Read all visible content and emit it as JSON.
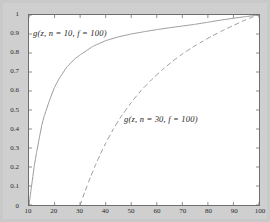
{
  "chart_data": {
    "type": "line",
    "title": "",
    "xlabel": "",
    "ylabel": "",
    "xlim": [
      10,
      100
    ],
    "ylim": [
      0,
      1
    ],
    "grid": false,
    "legend_position": "inline-annotations",
    "xticks": [
      "10",
      "20",
      "30",
      "40",
      "50",
      "60",
      "70",
      "80",
      "90",
      "100"
    ],
    "xtick_values": [
      10,
      20,
      30,
      40,
      50,
      60,
      70,
      80,
      90,
      100
    ],
    "yticks": [
      "0",
      "0.1",
      "0.2",
      "0.3",
      "0.4",
      "0.5",
      "0.6",
      "0.7",
      "0.8",
      "0.9",
      "1"
    ],
    "ytick_values": [
      0,
      0.1,
      0.2,
      0.3,
      0.4,
      0.5,
      0.6,
      0.7,
      0.8,
      0.9,
      1
    ],
    "series": [
      {
        "name": "g(z, n = 10, f = 100)",
        "style": "solid",
        "color": "#9a9a9a",
        "label_text": "g(z, n = 10, f = 100)",
        "x": [
          10,
          11,
          12,
          13,
          14,
          15,
          16,
          18,
          20,
          22,
          25,
          28,
          30,
          35,
          40,
          45,
          50,
          55,
          60,
          65,
          70,
          75,
          80,
          85,
          90,
          95,
          100
        ],
        "values": [
          0,
          0.1,
          0.2,
          0.28,
          0.35,
          0.42,
          0.47,
          0.55,
          0.62,
          0.67,
          0.73,
          0.77,
          0.79,
          0.835,
          0.865,
          0.885,
          0.9,
          0.912,
          0.923,
          0.933,
          0.942,
          0.951,
          0.962,
          0.973,
          0.983,
          0.992,
          1
        ]
      },
      {
        "name": "g(z, n = 30, f = 100)",
        "style": "dashed",
        "color": "#9a9a9a",
        "label_text": "g(z, n = 30, f = 100)",
        "x": [
          30,
          32,
          34,
          36,
          38,
          40,
          43,
          46,
          50,
          54,
          58,
          62,
          66,
          70,
          74,
          78,
          82,
          86,
          90,
          94,
          97,
          100
        ],
        "values": [
          0,
          0.075,
          0.145,
          0.21,
          0.27,
          0.325,
          0.4,
          0.465,
          0.54,
          0.605,
          0.66,
          0.71,
          0.755,
          0.795,
          0.83,
          0.862,
          0.892,
          0.92,
          0.945,
          0.97,
          0.987,
          1
        ]
      }
    ]
  },
  "figure": {
    "background_color": "#c9c9c9",
    "axes_background_color": "#ffffff",
    "axes_border_color": "#6e6e6e"
  }
}
